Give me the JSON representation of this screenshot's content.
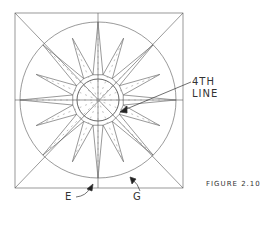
{
  "figure": {
    "caption": "FIGURE 2.10",
    "labels": {
      "fourth_line_1": "4TH",
      "fourth_line_2": "LINE",
      "e": "E",
      "g": "G"
    },
    "geometry": {
      "square": [
        15,
        13,
        183,
        188
      ],
      "center": [
        98,
        100
      ],
      "outer_radius": 78,
      "inner_radius": 21,
      "star_points": 16
    },
    "colors": {
      "line": "#555555",
      "dashed": "#999999",
      "text": "#333333"
    }
  }
}
